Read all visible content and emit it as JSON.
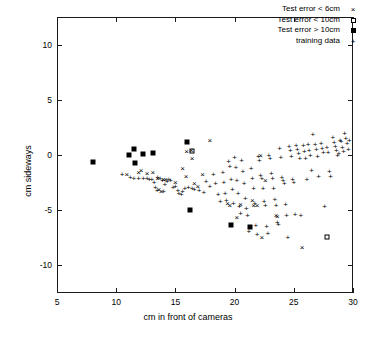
{
  "chart_data": {
    "type": "scatter",
    "title": "",
    "xlabel": "cm in front of cameras",
    "ylabel": "cm sideways",
    "xlim": [
      5,
      30
    ],
    "ylim": [
      -12.5,
      12.5
    ],
    "xticks": [
      5,
      10,
      15,
      20,
      25,
      30
    ],
    "yticks": [
      10,
      5,
      0,
      -5,
      -10
    ],
    "grid": false,
    "legend_position": "top-right",
    "legend": [
      {
        "label": "Test error < 6cm",
        "marker": "x"
      },
      {
        "label": "Test error < 10cm",
        "marker": "open-square"
      },
      {
        "label": "Test error > 10cm",
        "marker": "filled-square"
      },
      {
        "label": "training data",
        "marker": "+"
      }
    ],
    "series": [
      {
        "name": "Test error > 10cm",
        "marker": "filled-square",
        "points": [
          [
            8.0,
            -0.6
          ],
          [
            11.1,
            0.0
          ],
          [
            11.5,
            0.55
          ],
          [
            11.6,
            -0.75
          ],
          [
            12.3,
            0.1
          ],
          [
            13.1,
            0.15
          ],
          [
            16.0,
            1.2
          ],
          [
            16.2,
            -5.0
          ],
          [
            19.7,
            -6.3
          ],
          [
            21.3,
            -6.5
          ]
        ]
      },
      {
        "name": "Test error < 10cm",
        "marker": "open-square",
        "points": [
          [
            16.4,
            0.35
          ],
          [
            27.8,
            -7.4
          ]
        ]
      },
      {
        "name": "Test error < 6cm",
        "marker": "x",
        "points": [
          [
            10.9,
            -1.85
          ],
          [
            11.9,
            -1.6
          ],
          [
            12.1,
            -1.45
          ],
          [
            12.6,
            -1.7
          ],
          [
            13.1,
            -1.6
          ],
          [
            13.5,
            -2.15
          ],
          [
            13.6,
            -3.2
          ],
          [
            13.8,
            -3.35
          ],
          [
            14.0,
            -2.25
          ],
          [
            14.2,
            -2.3
          ],
          [
            15.0,
            -2.55
          ],
          [
            15.6,
            -1.25
          ],
          [
            15.9,
            -1.95
          ],
          [
            15.95,
            0.25
          ],
          [
            16.35,
            0.35
          ],
          [
            16.4,
            -0.35
          ],
          [
            16.6,
            -2.6
          ],
          [
            16.9,
            -2.9
          ],
          [
            17.3,
            -1.85
          ],
          [
            17.9,
            1.25
          ],
          [
            19.4,
            -4.45
          ],
          [
            19.6,
            -4.6
          ],
          [
            20.2,
            -5.7
          ],
          [
            20.5,
            -4.5
          ],
          [
            21.5,
            -4.15
          ],
          [
            21.6,
            -4.6
          ],
          [
            21.9,
            -4.65
          ],
          [
            22.2,
            -0.1
          ],
          [
            22.3,
            -7.5
          ],
          [
            22.6,
            -2.4
          ],
          [
            23.5,
            -5.55
          ],
          [
            23.6,
            -5.6
          ],
          [
            25.7,
            -8.4
          ]
        ]
      },
      {
        "name": "training data",
        "marker": "+",
        "points": [
          [
            10.5,
            -1.85
          ],
          [
            11.2,
            -2.1
          ],
          [
            11.5,
            -2.15
          ],
          [
            11.9,
            -2.2
          ],
          [
            12.3,
            -2.2
          ],
          [
            12.6,
            -2.2
          ],
          [
            12.8,
            -2.25
          ],
          [
            13.0,
            -2.3
          ],
          [
            13.2,
            -2.5
          ],
          [
            13.3,
            -3.0
          ],
          [
            13.45,
            -3.3
          ],
          [
            13.5,
            -2.1
          ],
          [
            13.7,
            -2.2
          ],
          [
            13.9,
            -2.35
          ],
          [
            14.0,
            -3.35
          ],
          [
            14.1,
            -2.7
          ],
          [
            14.3,
            -2.45
          ],
          [
            14.45,
            -2.3
          ],
          [
            14.6,
            -2.35
          ],
          [
            14.8,
            -3.0
          ],
          [
            15.0,
            -2.9
          ],
          [
            15.2,
            -3.25
          ],
          [
            15.3,
            -3.5
          ],
          [
            15.5,
            -3.6
          ],
          [
            15.6,
            -3.35
          ],
          [
            15.8,
            -3.1
          ],
          [
            16.1,
            -3.0
          ],
          [
            16.4,
            -3.1
          ],
          [
            16.6,
            -3.2
          ],
          [
            17.0,
            -3.3
          ],
          [
            17.4,
            -3.4
          ],
          [
            17.6,
            -2.45
          ],
          [
            17.9,
            -2.9
          ],
          [
            18.2,
            -1.8
          ],
          [
            18.4,
            -2.6
          ],
          [
            18.6,
            -3.65
          ],
          [
            18.8,
            -4.3
          ],
          [
            19.0,
            -1.65
          ],
          [
            19.1,
            -2.55
          ],
          [
            19.2,
            -3.5
          ],
          [
            19.3,
            -4.15
          ],
          [
            19.5,
            -0.65
          ],
          [
            19.6,
            -1.05
          ],
          [
            19.7,
            -2.3
          ],
          [
            19.8,
            -3.2
          ],
          [
            19.9,
            -4.4
          ],
          [
            20.0,
            -0.25
          ],
          [
            20.1,
            -1.2
          ],
          [
            20.2,
            -2.35
          ],
          [
            20.3,
            -3.55
          ],
          [
            20.4,
            -4.75
          ],
          [
            20.5,
            -5.3
          ],
          [
            20.6,
            -0.5
          ],
          [
            20.7,
            -1.55
          ],
          [
            20.8,
            -2.6
          ],
          [
            20.9,
            -3.95
          ],
          [
            21.0,
            -4.9
          ],
          [
            21.1,
            -5.5
          ],
          [
            21.2,
            -7.0
          ],
          [
            21.4,
            -1.3
          ],
          [
            21.5,
            -2.2
          ],
          [
            21.6,
            -3.1
          ],
          [
            21.7,
            -4.4
          ],
          [
            21.8,
            -6.4
          ],
          [
            21.9,
            -7.25
          ],
          [
            22.0,
            -0.2
          ],
          [
            22.1,
            -0.55
          ],
          [
            22.2,
            -1.9
          ],
          [
            22.3,
            -2.2
          ],
          [
            22.4,
            -3.05
          ],
          [
            22.5,
            -4.3
          ],
          [
            22.6,
            -4.6
          ],
          [
            22.7,
            -6.5
          ],
          [
            22.8,
            -7.2
          ],
          [
            22.9,
            -0.05
          ],
          [
            23.0,
            -0.35
          ],
          [
            23.1,
            -1.75
          ],
          [
            23.2,
            -2.2
          ],
          [
            23.3,
            -3.1
          ],
          [
            23.4,
            -4.1
          ],
          [
            23.5,
            -4.65
          ],
          [
            23.6,
            -6.15
          ],
          [
            23.7,
            -6.35
          ],
          [
            23.8,
            0.55
          ],
          [
            23.9,
            -0.25
          ],
          [
            24.0,
            -2.1
          ],
          [
            24.1,
            -2.35
          ],
          [
            24.2,
            -2.6
          ],
          [
            24.3,
            -4.5
          ],
          [
            24.4,
            -5.55
          ],
          [
            24.5,
            -7.5
          ],
          [
            24.6,
            0.7
          ],
          [
            24.7,
            0.35
          ],
          [
            24.8,
            -0.15
          ],
          [
            24.9,
            -2.3
          ],
          [
            25.0,
            -2.5
          ],
          [
            25.1,
            -5.45
          ],
          [
            25.2,
            0.8
          ],
          [
            25.3,
            0.45
          ],
          [
            25.4,
            0.1
          ],
          [
            25.5,
            -0.4
          ],
          [
            25.6,
            -5.5
          ],
          [
            25.8,
            0.85
          ],
          [
            25.9,
            0.3
          ],
          [
            26.0,
            -0.35
          ],
          [
            26.1,
            -2.25
          ],
          [
            26.2,
            0.9
          ],
          [
            26.3,
            0.4
          ],
          [
            26.4,
            -0.1
          ],
          [
            26.5,
            -1.45
          ],
          [
            26.6,
            1.85
          ],
          [
            26.8,
            0.95
          ],
          [
            26.9,
            0.45
          ],
          [
            27.0,
            -0.2
          ],
          [
            27.1,
            -2.0
          ],
          [
            27.3,
            1.0
          ],
          [
            27.4,
            0.5
          ],
          [
            27.5,
            0.15
          ],
          [
            27.6,
            -4.7
          ],
          [
            27.8,
            0.6
          ],
          [
            27.9,
            0.2
          ],
          [
            28.0,
            -1.55
          ],
          [
            28.1,
            -2.0
          ],
          [
            28.3,
            1.55
          ],
          [
            28.4,
            1.1
          ],
          [
            28.5,
            0.75
          ],
          [
            28.6,
            0.4
          ],
          [
            28.7,
            -0.1
          ],
          [
            28.8,
            0.05
          ],
          [
            28.9,
            1.3
          ],
          [
            29.0,
            1.15
          ],
          [
            29.1,
            0.65
          ],
          [
            29.2,
            0.25
          ],
          [
            29.3,
            1.9
          ],
          [
            29.4,
            1.45
          ],
          [
            29.5,
            1.0
          ],
          [
            29.6,
            0.45
          ],
          [
            29.7,
            1.25
          ]
        ]
      }
    ]
  }
}
